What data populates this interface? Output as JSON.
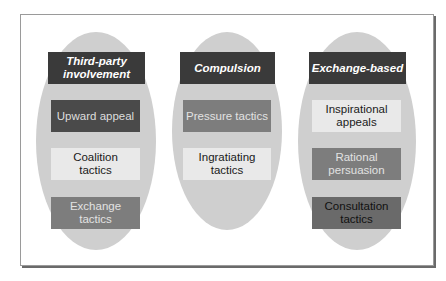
{
  "diagram": {
    "columns": [
      {
        "header": "Third-party involvement",
        "header_lines": [
          "Third-party",
          "involvement"
        ],
        "items": [
          {
            "label": "Upward appeal",
            "shade": "dark"
          },
          {
            "label": "Coalition tactics",
            "shade": "light"
          },
          {
            "label": "Exchange tactics",
            "shade": "mid"
          }
        ]
      },
      {
        "header": "Compulsion",
        "header_lines": [
          "Compulsion"
        ],
        "items": [
          {
            "label": "Pressure tactics",
            "shade": "mid"
          },
          {
            "label": "Ingratiating tactics",
            "shade": "light"
          }
        ]
      },
      {
        "header": "Exchange-based",
        "header_lines": [
          "Exchange-based"
        ],
        "items": [
          {
            "label": "Inspirational appeals",
            "shade": "light"
          },
          {
            "label": "Rational persuasion",
            "shade": "mid"
          },
          {
            "label": "Consultation tactics",
            "shade": "midd"
          }
        ]
      }
    ],
    "colors": {
      "oval": "#cfcfcf",
      "header_bg": "#3a3a3a",
      "dark": "#4a4a4a",
      "mid": "#7d7d7d",
      "light": "#e9e9e9"
    }
  }
}
